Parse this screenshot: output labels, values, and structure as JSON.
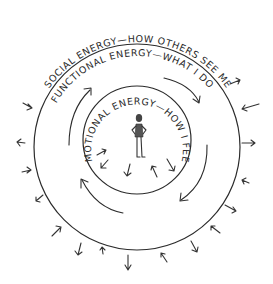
{
  "diagram": {
    "labels": {
      "social": "SOCIAL ENERGY—HOW OTHERS SEE ME",
      "functional": "FUNCTIONAL ENERGY—WHAT I DO",
      "emotional": "EMOTIONAL ENERGY—HOW I FEEL"
    },
    "center_figure": "person-standing-hands-on-hips",
    "colors": {
      "line": "#2b2b2b",
      "background": "#ffffff"
    }
  }
}
